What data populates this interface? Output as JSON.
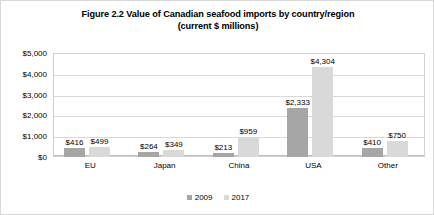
{
  "chart_data": {
    "type": "bar",
    "title": "Figure 2.2 Value of Canadian seafood imports by country/region (current $ millions)",
    "title_line1": "Figure 2.2 Value of Canadian seafood imports by country/region",
    "title_line2": "(current $ millions)",
    "xlabel": "",
    "ylabel": "",
    "categories": [
      "EU",
      "Japan",
      "China",
      "USA",
      "Other"
    ],
    "series": [
      {
        "name": "2009",
        "color": "#a6a6a6",
        "values": [
          416,
          264,
          213,
          2333,
          410
        ],
        "labels": [
          "$416",
          "$264",
          "$213",
          "$2,333",
          "$410"
        ]
      },
      {
        "name": "2017",
        "color": "#d9d9d9",
        "values": [
          499,
          349,
          959,
          4304,
          750
        ],
        "labels": [
          "$499",
          "$349",
          "$959",
          "$4,304",
          "$750"
        ]
      }
    ],
    "ylim": [
      0,
      5000
    ],
    "yticks": [
      0,
      1000,
      2000,
      3000,
      4000,
      5000
    ],
    "ytick_labels": [
      "$0",
      "$1,000",
      "$2,000",
      "$3,000",
      "$4,000",
      "$5,000"
    ],
    "grid": true,
    "legend_position": "bottom"
  }
}
